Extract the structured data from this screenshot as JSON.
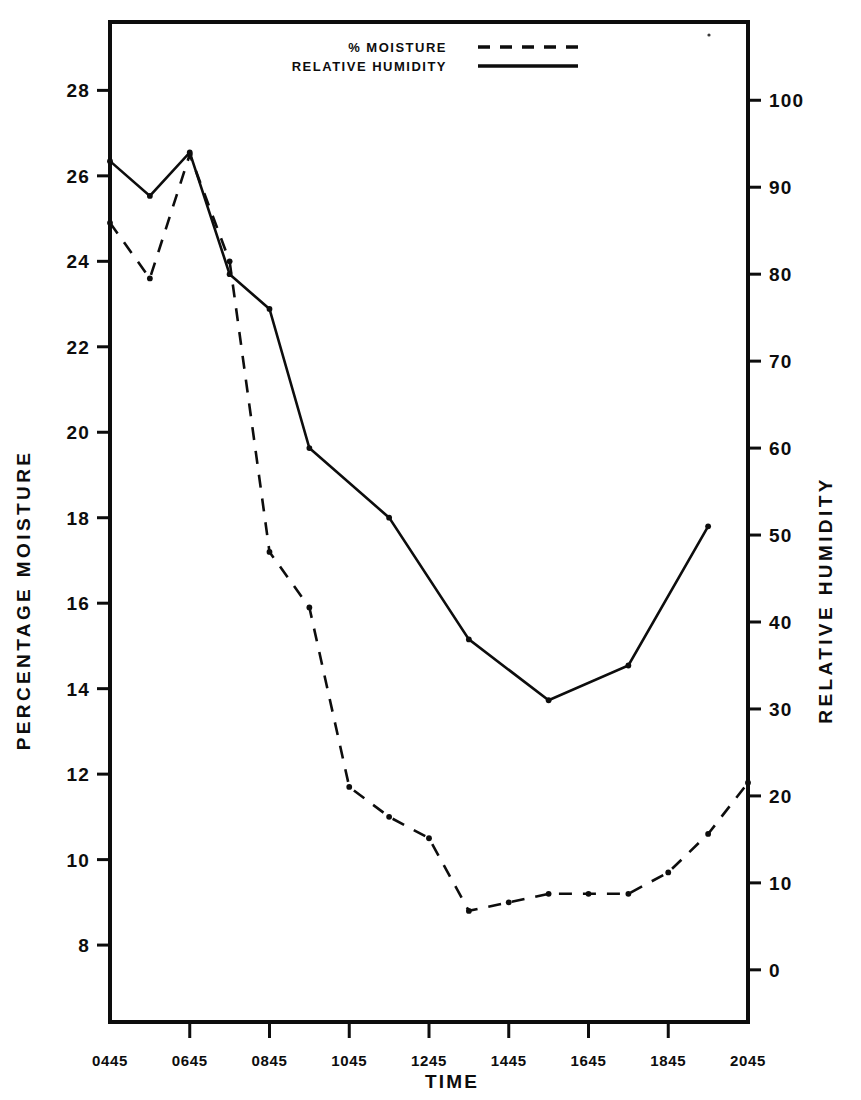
{
  "chart_data": {
    "type": "line",
    "title": "",
    "xlabel": "TIME",
    "ylabel": "PERCENTAGE MOISTURE",
    "y2label": "RELATIVE HUMIDITY",
    "grid": false,
    "legend_position": "top-center",
    "x_tick_labels": [
      "0445",
      "0645",
      "0845",
      "1045",
      "1245",
      "1445",
      "1645",
      "1845",
      "2045"
    ],
    "x_tick_hours": [
      4.75,
      6.75,
      8.75,
      10.75,
      12.75,
      14.75,
      16.75,
      18.75,
      20.75
    ],
    "xlim_hours": [
      4.75,
      20.75
    ],
    "y_tick_labels": [
      "28",
      "26",
      "24",
      "22",
      "20",
      "18",
      "16",
      "14",
      "12",
      "10",
      "8"
    ],
    "y_tick_values": [
      28,
      26,
      24,
      22,
      20,
      18,
      16,
      14,
      12,
      10,
      8
    ],
    "ylim": [
      6.2,
      29.6
    ],
    "y2_tick_labels": [
      "100",
      "90",
      "80",
      "70",
      "60",
      "50",
      "40",
      "30",
      "20",
      "10",
      "0"
    ],
    "y2_tick_values": [
      100,
      90,
      80,
      70,
      60,
      50,
      40,
      30,
      20,
      10,
      0
    ],
    "y2lim": [
      -6,
      109
    ],
    "series": [
      {
        "name": "% MOISTURE",
        "axis": "left",
        "style": "dashed",
        "points": [
          {
            "t": 4.75,
            "label": "0445",
            "value": 24.9
          },
          {
            "t": 5.75,
            "label": "0545",
            "value": 23.6
          },
          {
            "t": 6.75,
            "label": "0645",
            "value": 26.5
          },
          {
            "t": 7.75,
            "label": "0745",
            "value": 24.0
          },
          {
            "t": 8.75,
            "label": "0845",
            "value": 17.2
          },
          {
            "t": 9.75,
            "label": "0945",
            "value": 15.9
          },
          {
            "t": 10.75,
            "label": "1045",
            "value": 11.7
          },
          {
            "t": 11.75,
            "label": "1145",
            "value": 11.0
          },
          {
            "t": 12.75,
            "label": "1245",
            "value": 10.5
          },
          {
            "t": 13.75,
            "label": "1345",
            "value": 8.8
          },
          {
            "t": 14.75,
            "label": "1445",
            "value": 9.0
          },
          {
            "t": 15.75,
            "label": "1545",
            "value": 9.2
          },
          {
            "t": 16.75,
            "label": "1645",
            "value": 9.2
          },
          {
            "t": 17.75,
            "label": "1745",
            "value": 9.2
          },
          {
            "t": 18.75,
            "label": "1845",
            "value": 9.7
          },
          {
            "t": 19.75,
            "label": "1945",
            "value": 10.6
          },
          {
            "t": 20.75,
            "label": "2045",
            "value": 11.8
          }
        ]
      },
      {
        "name": "RELATIVE HUMIDITY",
        "axis": "right",
        "style": "solid",
        "points": [
          {
            "t": 4.75,
            "label": "0445",
            "value": 93
          },
          {
            "t": 5.75,
            "label": "0545",
            "value": 89
          },
          {
            "t": 6.75,
            "label": "0645",
            "value": 94
          },
          {
            "t": 7.75,
            "label": "0745",
            "value": 80
          },
          {
            "t": 8.75,
            "label": "0845",
            "value": 76
          },
          {
            "t": 9.75,
            "label": "0945",
            "value": 60
          },
          {
            "t": 11.75,
            "label": "1145",
            "value": 52
          },
          {
            "t": 13.75,
            "label": "1345",
            "value": 38
          },
          {
            "t": 15.75,
            "label": "1545",
            "value": 31
          },
          {
            "t": 17.75,
            "label": "1745",
            "value": 35
          },
          {
            "t": 19.75,
            "label": "1945",
            "value": 51
          }
        ]
      }
    ]
  },
  "legend": {
    "items": [
      {
        "label": "% MOISTURE",
        "style": "dashed"
      },
      {
        "label": "RELATIVE HUMIDITY",
        "style": "solid"
      }
    ]
  },
  "colors": {
    "ink": "#0d0d0d",
    "background": "#ffffff"
  }
}
